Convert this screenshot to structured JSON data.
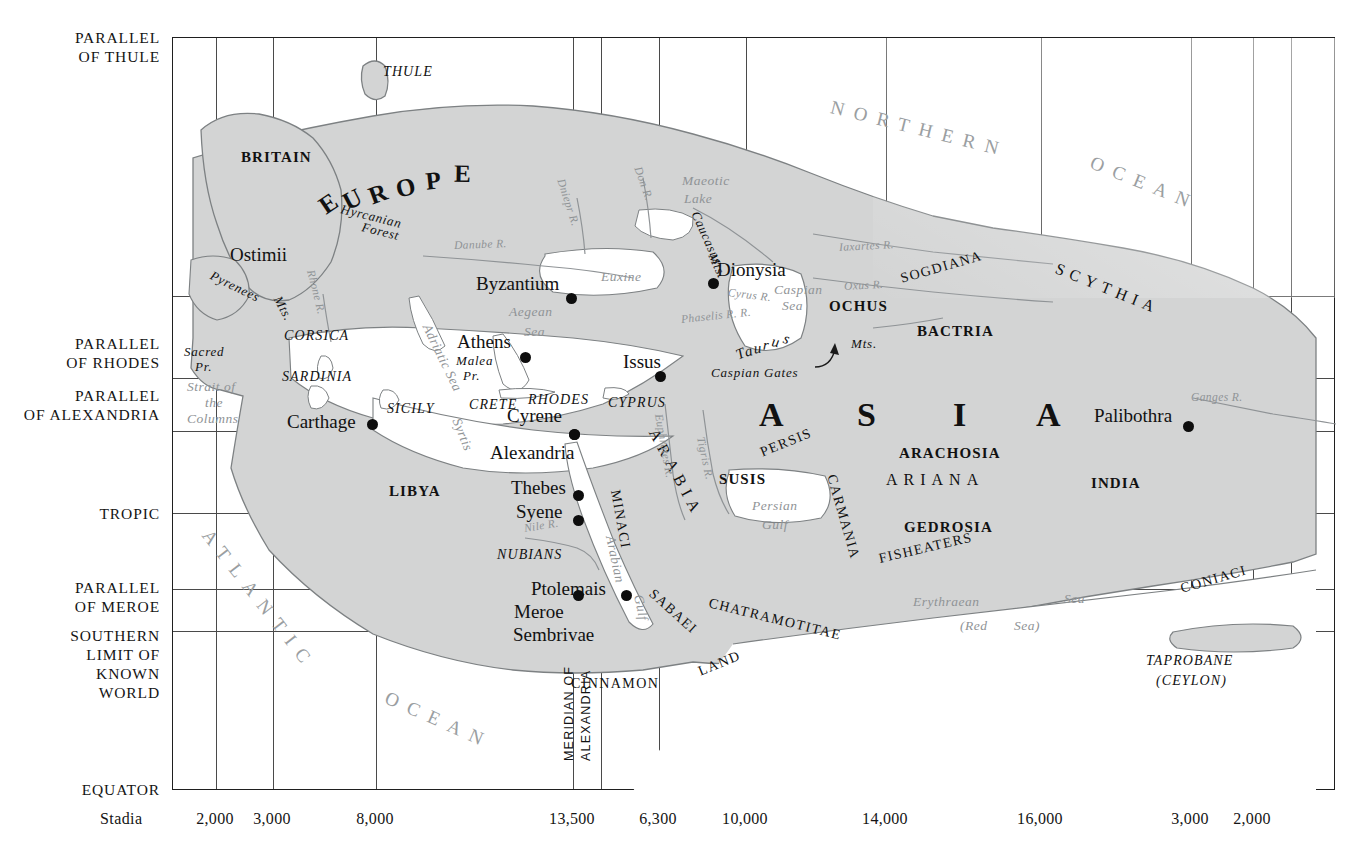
{
  "map": {
    "title": "Eratosthenes World Map",
    "land_fill": "#d3d4d4",
    "land_stroke": "#7d8183",
    "grid_color": "#4a4a4a",
    "frame_color": "#1f1f1f",
    "water_text_color": "#8f9396"
  },
  "margin_labels": [
    {
      "name": "parallel-of-thule",
      "text": "PARALLEL\nOF THULE",
      "x": 160,
      "y": 28
    },
    {
      "name": "parallel-of-rhodes",
      "text": "PARALLEL\nOF RHODES",
      "x": 160,
      "y": 334
    },
    {
      "name": "parallel-of-alexandria",
      "text": "PARALLEL\nOF ALEXANDRIA",
      "x": 160,
      "y": 386
    },
    {
      "name": "tropic",
      "text": "TROPIC",
      "x": 160,
      "y": 504
    },
    {
      "name": "parallel-of-meroe",
      "text": "PARALLEL\nOF MEROE",
      "x": 160,
      "y": 578
    },
    {
      "name": "southern-limit",
      "text": "SOUTHERN\nLIMIT OF\nKNOWN\nWORLD",
      "x": 160,
      "y": 626
    },
    {
      "name": "equator",
      "text": "EQUATOR",
      "x": 160,
      "y": 780
    }
  ],
  "grid": {
    "vertical_x": [
      215,
      272,
      375,
      572,
      600,
      658,
      745,
      885,
      1040,
      1190,
      1252,
      1290
    ],
    "horizontal_y": [
      295,
      377,
      430,
      512,
      588,
      630
    ]
  },
  "scale": {
    "word": "Stadia",
    "word_x": 100,
    "values": [
      {
        "label": "2,000",
        "x": 215
      },
      {
        "label": "3,000",
        "x": 272
      },
      {
        "label": "8,000",
        "x": 375
      },
      {
        "label": "13,500",
        "x": 572
      },
      {
        "label": "6,300",
        "x": 658
      },
      {
        "label": "10,000",
        "x": 745
      },
      {
        "label": "14,000",
        "x": 885
      },
      {
        "label": "16,000",
        "x": 1040
      },
      {
        "label": "3,000",
        "x": 1190
      },
      {
        "label": "2,000",
        "x": 1252
      }
    ]
  },
  "meridian_label": {
    "line1": "MERIDIAN OF",
    "line2": "ALEXANDRIA"
  },
  "cities": [
    {
      "name": "Byzantium",
      "label": "Byzantium",
      "lx": 475,
      "ly": 272,
      "dx": 565,
      "dy": 292
    },
    {
      "name": "Dionysia",
      "label": "Dionysia",
      "lx": 716,
      "ly": 258,
      "dx": 707,
      "dy": 277
    },
    {
      "name": "Athens",
      "label": "Athens",
      "lx": 456,
      "ly": 330,
      "dx": 519,
      "dy": 351
    },
    {
      "name": "Issus",
      "label": "Issus",
      "lx": 622,
      "ly": 350,
      "dx": 654,
      "dy": 370
    },
    {
      "name": "Carthage",
      "label": "Carthage",
      "lx": 286,
      "ly": 410,
      "dx": 366,
      "dy": 418
    },
    {
      "name": "Cyrene",
      "label": "Cyrene",
      "lx": 506,
      "ly": 404,
      "dx": 568,
      "dy": 428
    },
    {
      "name": "Alexandria",
      "label": "Alexandria",
      "lx": 489,
      "ly": 441,
      "dx": 568,
      "dy": 428
    },
    {
      "name": "Palibothra",
      "label": "Palibothra",
      "lx": 1093,
      "ly": 404,
      "dx": 1182,
      "dy": 420
    },
    {
      "name": "Thebes",
      "label": "Thebes",
      "lx": 510,
      "ly": 476,
      "dx": 572,
      "dy": 489
    },
    {
      "name": "Syene",
      "label": "Syene",
      "lx": 515,
      "ly": 500,
      "dx": 572,
      "dy": 514
    },
    {
      "name": "Ptolemais",
      "label": "Ptolemais",
      "lx": 530,
      "ly": 577,
      "dx": 620,
      "dy": 589
    },
    {
      "name": "Meroe",
      "label": "Meroe",
      "lx": 513,
      "ly": 600,
      "dx": 572,
      "dy": 589
    },
    {
      "name": "Sembrivae",
      "label": "Sembrivae",
      "lx": 512,
      "ly": 623,
      "dx": null,
      "dy": null
    }
  ],
  "regions_bold": [
    {
      "label": "BRITAIN",
      "x": 240,
      "y": 148
    },
    {
      "label": "OCHUS",
      "x": 828,
      "y": 297
    },
    {
      "label": "BACTRIA",
      "x": 916,
      "y": 322
    },
    {
      "label": "SUSIS",
      "x": 718,
      "y": 470
    },
    {
      "label": "ARACHOSIA",
      "x": 898,
      "y": 444
    },
    {
      "label": "GEDROSIA",
      "x": 903,
      "y": 518
    },
    {
      "label": "LIBYA",
      "x": 388,
      "y": 482
    },
    {
      "label": "INDIA",
      "x": 1090,
      "y": 474
    }
  ],
  "regions_italic_caps": [
    {
      "label": "THULE",
      "x": 382,
      "y": 63
    },
    {
      "label": "CORSICA",
      "x": 283,
      "y": 327
    },
    {
      "label": "SARDINIA",
      "x": 281,
      "y": 368
    },
    {
      "label": "SICILY",
      "x": 386,
      "y": 400
    },
    {
      "label": "CRETE",
      "x": 468,
      "y": 396
    },
    {
      "label": "RHODES",
      "x": 527,
      "y": 391
    },
    {
      "label": "CYPRUS",
      "x": 607,
      "y": 394
    },
    {
      "label": "NUBIANS",
      "x": 496,
      "y": 546
    },
    {
      "label": "TAPROBANE",
      "x": 1145,
      "y": 652
    },
    {
      "label": "(CEYLON)",
      "x": 1155,
      "y": 672
    }
  ],
  "regions_caps": [
    {
      "label": "SOGDIANA",
      "x": 900,
      "y": 270,
      "rot": -16
    },
    {
      "label": "PERSIS",
      "x": 760,
      "y": 444,
      "rot": -22
    },
    {
      "label": "ARIANA",
      "x": 885,
      "y": 470,
      "rot": 0,
      "spaced": true
    },
    {
      "label": "CARMANIA",
      "x": 830,
      "y": 466,
      "rot": 74
    },
    {
      "label": "CHATRAMOTITAE",
      "x": 708,
      "y": 594,
      "rot": 14
    },
    {
      "label": "SABAEI",
      "x": 650,
      "y": 583,
      "rot": 42
    },
    {
      "label": "FISHEATERS",
      "x": 878,
      "y": 550,
      "rot": -13
    },
    {
      "label": "CONIACI",
      "x": 1180,
      "y": 580,
      "rot": -16
    },
    {
      "label": "CINNAMON",
      "x": 570,
      "y": 675,
      "rot": 0
    },
    {
      "label": "LAND",
      "x": 698,
      "y": 663,
      "rot": -22
    },
    {
      "label": "MINACI",
      "x": 614,
      "y": 481,
      "rot": 80
    },
    {
      "label": "SCYTHIA",
      "x": 1055,
      "y": 258,
      "rot": 22,
      "spaced": true
    },
    {
      "label": "ARABIA",
      "x": 652,
      "y": 420,
      "rot": 62,
      "spaced": true
    }
  ],
  "continents": [
    {
      "label": "EUROPE",
      "x": 300,
      "y": 160,
      "type": "arc"
    }
  ],
  "asia_letters": [
    {
      "label": "A",
      "x": 758,
      "y": 395
    },
    {
      "label": "S",
      "x": 856,
      "y": 395
    },
    {
      "label": "I",
      "x": 952,
      "y": 395
    },
    {
      "label": "A",
      "x": 1035,
      "y": 395
    }
  ],
  "waters": [
    {
      "label": "NORTHERN",
      "x": 830,
      "y": 95,
      "rot": 14,
      "cls": "ocean-big"
    },
    {
      "label": "OCEAN",
      "x": 1090,
      "y": 150,
      "rot": 22,
      "cls": "ocean-big"
    },
    {
      "label": "ATLANTIC",
      "x": 205,
      "y": 520,
      "rot": 52,
      "cls": "ocean-big"
    },
    {
      "label": "OCEAN",
      "x": 385,
      "y": 685,
      "rot": 24,
      "cls": "ocean-big"
    },
    {
      "label": "Maeotic",
      "x": 681,
      "y": 172,
      "rot": 0,
      "cls": "water"
    },
    {
      "label": "Lake",
      "x": 683,
      "y": 190,
      "rot": 0,
      "cls": "water"
    },
    {
      "label": "Euxine",
      "x": 600,
      "y": 268,
      "rot": 0,
      "cls": "water"
    },
    {
      "label": "Caspian",
      "x": 773,
      "y": 281,
      "rot": 0,
      "cls": "water"
    },
    {
      "label": "Sea",
      "x": 781,
      "y": 297,
      "rot": 0,
      "cls": "water"
    },
    {
      "label": "Aegean",
      "x": 508,
      "y": 303,
      "rot": 0,
      "cls": "water"
    },
    {
      "label": "Sea",
      "x": 523,
      "y": 323,
      "rot": 0,
      "cls": "water"
    },
    {
      "label": "Adriatic Sea",
      "x": 425,
      "y": 316,
      "rot": 64,
      "cls": "water"
    },
    {
      "label": "Syrtis",
      "x": 455,
      "y": 410,
      "rot": 68,
      "cls": "water"
    },
    {
      "label": "Persian",
      "x": 751,
      "y": 497,
      "rot": 0,
      "cls": "water"
    },
    {
      "label": "Gulf",
      "x": 761,
      "y": 516,
      "rot": 0,
      "cls": "water"
    },
    {
      "label": "Erythraean",
      "x": 912,
      "y": 593,
      "rot": 0,
      "cls": "water"
    },
    {
      "label": "Sea",
      "x": 1063,
      "y": 590,
      "rot": 0,
      "cls": "water"
    },
    {
      "label": "(Red",
      "x": 959,
      "y": 617,
      "rot": 0,
      "cls": "water"
    },
    {
      "label": "Sea)",
      "x": 1013,
      "y": 617,
      "rot": 0,
      "cls": "water"
    },
    {
      "label": "Arabian",
      "x": 609,
      "y": 527,
      "rot": 78,
      "cls": "water"
    },
    {
      "label": "Gulf",
      "x": 637,
      "y": 586,
      "rot": 78,
      "cls": "water"
    },
    {
      "label": "Strait of",
      "x": 186,
      "y": 378,
      "rot": 0,
      "cls": "water"
    },
    {
      "label": "the",
      "x": 204,
      "y": 394,
      "rot": 0,
      "cls": "water"
    },
    {
      "label": "Columns",
      "x": 186,
      "y": 410,
      "rot": 0,
      "cls": "water"
    }
  ],
  "rivers": [
    {
      "label": "Danube  R.",
      "x": 453,
      "y": 238,
      "rot": -2
    },
    {
      "label": "Dniepr R.",
      "x": 560,
      "y": 172,
      "rot": 72
    },
    {
      "label": "Don  R.",
      "x": 637,
      "y": 160,
      "rot": 70
    },
    {
      "label": "Rhone R.",
      "x": 310,
      "y": 263,
      "rot": 76
    },
    {
      "label": "Iaxartes   R.",
      "x": 838,
      "y": 240,
      "rot": -3
    },
    {
      "label": "Oxus    R.",
      "x": 843,
      "y": 279,
      "rot": -3
    },
    {
      "label": "Ganges  R.",
      "x": 1190,
      "y": 390,
      "rot": 0
    },
    {
      "label": "Phaselis R.  R.",
      "x": 680,
      "y": 312,
      "rot": -6
    },
    {
      "label": "Cyrus   R.",
      "x": 727,
      "y": 285,
      "rot": 7
    },
    {
      "label": "Euphrates R.",
      "x": 658,
      "y": 407,
      "rot": 80
    },
    {
      "label": "Tigris R.",
      "x": 700,
      "y": 430,
      "rot": 78
    },
    {
      "label": "Nile  R.",
      "x": 523,
      "y": 521,
      "rot": -9
    }
  ],
  "mountains": [
    {
      "label": "Pyrenees",
      "x": 210,
      "y": 266,
      "rot": 26
    },
    {
      "label": "Mts.",
      "x": 276,
      "y": 288,
      "rot": 62
    },
    {
      "label": "Caucasus",
      "x": 694,
      "y": 203,
      "rot": 66
    },
    {
      "label": "Mts.",
      "x": 711,
      "y": 245,
      "rot": 66
    },
    {
      "label": "Hyrcanian",
      "x": 340,
      "y": 200,
      "rot": 14
    },
    {
      "label": "Forest",
      "x": 361,
      "y": 218,
      "rot": 14
    },
    {
      "label": "Taurus",
      "x": 730,
      "y": 330,
      "rot": 0,
      "arc": true
    },
    {
      "label": "Mts.",
      "x": 850,
      "y": 335,
      "rot": 0
    },
    {
      "label": "Caspian Gates",
      "x": 710,
      "y": 364,
      "rot": 0
    },
    {
      "label": "Sacred",
      "x": 183,
      "y": 343,
      "rot": 0
    },
    {
      "label": "Pr.",
      "x": 194,
      "y": 358,
      "rot": 0
    },
    {
      "label": "Malea",
      "x": 455,
      "y": 352,
      "rot": 0
    },
    {
      "label": "Pr.",
      "x": 462,
      "y": 367,
      "rot": 0
    },
    {
      "label": "Ostimii",
      "x": 229,
      "y": 243,
      "rot": 0,
      "big": true
    }
  ]
}
